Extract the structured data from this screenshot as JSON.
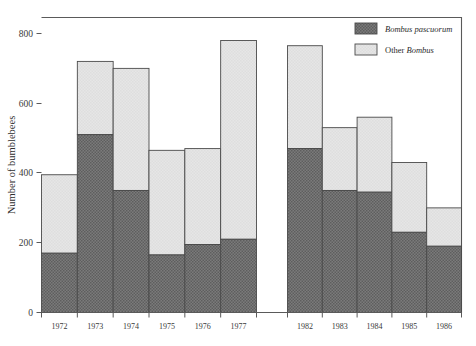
{
  "chart_data": {
    "type": "bar",
    "stacked": true,
    "title": "",
    "subtitle": "",
    "xlabel": "",
    "ylabel": "Number of bumblebees",
    "ylim": [
      0,
      800
    ],
    "yticks": [
      0,
      200,
      400,
      600,
      800
    ],
    "ytick_labels": [
      "0",
      "200",
      "400",
      "600",
      "800"
    ],
    "grid": false,
    "legend_position": "top-right",
    "categories": [
      "1972",
      "1973",
      "1974",
      "1975",
      "1976",
      "1977",
      "1982",
      "1983",
      "1984",
      "1985",
      "1986"
    ],
    "groups": [
      {
        "name": "first-period",
        "categories": [
          "1972",
          "1973",
          "1974",
          "1975",
          "1976",
          "1977"
        ]
      },
      {
        "name": "second-period",
        "categories": [
          "1982",
          "1983",
          "1984",
          "1985",
          "1986"
        ]
      }
    ],
    "series": [
      {
        "name": "Bombus pascuorum",
        "italic": true,
        "color": "#6f6f6f",
        "values": [
          170,
          510,
          350,
          165,
          195,
          210,
          470,
          350,
          345,
          230,
          190
        ]
      },
      {
        "name": "Other Bombus",
        "italic_word": "Bombus",
        "color": "#e2e2e2",
        "values": [
          225,
          210,
          350,
          300,
          275,
          570,
          295,
          180,
          215,
          200,
          110
        ]
      }
    ],
    "totals": [
      395,
      720,
      700,
      465,
      470,
      780,
      765,
      530,
      560,
      430,
      300
    ]
  },
  "legend": {
    "items": [
      {
        "label": "Bombus pascuorum",
        "swatch": "dark-hatched",
        "style": "italic"
      },
      {
        "label_prefix": "Other ",
        "label_italic": "Bombus",
        "label": "Other Bombus",
        "swatch": "light",
        "style": "mixed"
      }
    ]
  },
  "axis": {
    "y_title": "Number of bumblebees",
    "y_ticks": [
      "800",
      "600",
      "400",
      "200",
      "0"
    ],
    "x_ticks_left": [
      "1972",
      "1973",
      "1974",
      "1975",
      "1976",
      "1977"
    ],
    "x_ticks_right": [
      "1982",
      "1983",
      "1984",
      "1985",
      "1986"
    ]
  },
  "colors": {
    "series_dark": "#6f6f6f",
    "series_light": "#e2e2e2",
    "outline": "#4a4a4a",
    "axis": "#5a5a5a",
    "text": "#2b2b2b",
    "background": "#ffffff"
  }
}
